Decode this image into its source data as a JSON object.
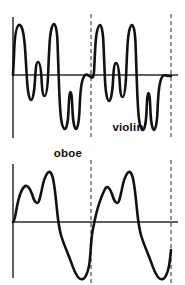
{
  "figure": {
    "title": "",
    "background_color": "#ffffff",
    "stroke_color": "#111111",
    "axis_color": "#2b2b2b",
    "period_marker_color": "#5a5a5a",
    "width": 185,
    "height": 285
  },
  "panels": [
    {
      "id": "violin",
      "label": "violin",
      "label_x": 128,
      "label_y": 131,
      "axis": {
        "vertical_x": 13,
        "vertical_y_top": 17,
        "vertical_y_bottom": 138,
        "horizontal_y": 75,
        "horizontal_x_start": 13,
        "horizontal_x_end": 178
      },
      "period_markers": [
        {
          "x": 91,
          "y_top": 14,
          "y_bottom": 140
        },
        {
          "x": 171,
          "y_top": 14,
          "y_bottom": 140
        }
      ],
      "path": "M13,75 L14,56 C14.5,38 16,26 19,25 C22,24 24,34 25,48 C26,62 26.5,72 27,80 C27.6,90 29,100 31,100 C33,100 34.5,90 35,80 C35.6,70 36,62 38,62 C40,62 41,70 41.5,78 C42,87 42.5,96 44.5,96 C46.5,96 47.5,86 48,77 C48.5,66 49,49 50,38 C51,28 52.5,24 54,24 C55.6,24 57,30 57.5,42 C58,55 58.5,72 59,85 C59.5,98 60,110 61,118 C62,126 63.5,129 65,129 C66.6,129 68,122 68.5,111 C69,100 69.3,92 70.5,92 C71.7,92 72,100 72.5,111 C73,122 74.5,129 76,129 C77.6,129 79,122 79.5,110 C80,97 80.5,88 82,82 C83.5,76 85,74.5 86.5,74.6 C88,74.7 89.5,76 91,77"
    }
  ],
  "violin_second_cycle_path": "M91,77 C92.5,78 93.5,78 94,72 C94.5,64 95,48 96,38 C97,29 98.5,25 100,25 C101.6,25 103,32 103.5,44 C104,56 104.5,70 105,80 C105.6,92 107,101 109,101 C111,101 112.5,91 113,81 C113.6,71 114,63 116,63 C118,63 119,71 119.5,79 C120,88 120.5,97 122.5,97 C124.5,97 125.5,87 126,78 C126.5,67 127,50 128,39 C129,29 130.5,25 132,25 C133.6,25 135,31 135.5,43 C136,56 136.5,73 137,86 C137.5,99 138,111 139,119 C140,127 141.5,130 143,130 C144.6,130 146,123 146.5,112 C147,101 147.3,93 148.5,93 C149.7,93 150,101 150.5,112 C151,123 152.5,130 154,130 C155.6,130 157,123 157.5,111 C158,98 158.5,89 160,83 C161.5,76 163,75 164.5,75.2 C166,75.4 167.5,76 171,76",
  "oboe_panel": {
    "id": "oboe",
    "label": "oboe",
    "label_x": 68,
    "label_y": 17,
    "axis": {
      "vertical_x": 13,
      "vertical_y_top": 24,
      "vertical_y_bottom": 138,
      "horizontal_y": 82,
      "horizontal_x_start": 13,
      "horizontal_x_end": 178
    },
    "period_markers": [
      {
        "x": 91,
        "y_top": 20,
        "y_bottom": 143
      },
      {
        "x": 171,
        "y_top": 20,
        "y_bottom": 143
      }
    ],
    "path_cycle_1": "M13,82 C14,82 15,78 16,72 C18,60 21,50 24,47 C27,44 30,48 32,54 C34,60 35,63 37,63 C39,63 40,58 41.5,51 C43,43 45,36 47.5,33 C50,30 52,33 53.5,41 C55,49 56,60 57,70 C58,80 59,88 61,95 C63,102 65.5,108 68,114 C70.5,120 73,128 75.5,133 C78,138 80.5,140 83,139 C85.5,138 87.5,133 89,126 C90,121 90.5,113 91,105",
    "path_cycle_2": "M91,105 C91.5,98 92.5,90 94,84 C95,79 96,74 97.5,69 C99.5,62 102,55 105,49 C107,45 110,48 112,54 C114,60 115,63 117,63 C119,63 120,58 121.5,51 C123,43 125,36 127.5,33 C130,30 132,33 133.5,41 C135,49 136,60 137,70 C138,80 139,88 141,95 C143,102 145.5,108 148,114 C150.5,120 153,128 155.5,133 C158,138 160.5,140 163,139 C165.5,138 167.5,133 169,126 C169.8,122 170.4,116 171,110"
  },
  "axis_labels": {
    "x_axis": "",
    "y_axis": ""
  },
  "chart_data": {
    "type": "line",
    "xlabel": "time",
    "ylabel": "amplitude",
    "grid": false,
    "legend_position": "inline",
    "panels": [
      {
        "name": "violin",
        "description": "Complex periodic waveform with many harmonics; two full periods shown between the vertical axis and the right dashed line.",
        "periods_shown": 2,
        "period_marker_x_positions": [
          91,
          171
        ],
        "zero_line_y": 75,
        "peak_amplitude_positive": 1.0,
        "peak_amplitude_negative": -0.9,
        "sample_points_cycle1": [
          {
            "t": 0.0,
            "a": 0.0
          },
          {
            "t": 0.04,
            "a": 0.95
          },
          {
            "t": 0.09,
            "a": 0.05
          },
          {
            "t": 0.13,
            "a": -0.25
          },
          {
            "t": 0.17,
            "a": 0.25
          },
          {
            "t": 0.21,
            "a": -0.3
          },
          {
            "t": 0.25,
            "a": 0.12
          },
          {
            "t": 0.3,
            "a": 0.98
          },
          {
            "t": 0.36,
            "a": 0.0
          },
          {
            "t": 0.42,
            "a": -0.85
          },
          {
            "t": 0.46,
            "a": -0.25
          },
          {
            "t": 0.5,
            "a": -0.85
          },
          {
            "t": 0.54,
            "a": 0.02
          },
          {
            "t": 0.57,
            "a": 0.0
          }
        ],
        "sample_points_cycle2": [
          {
            "t": 0.57,
            "a": 0.0
          },
          {
            "t": 0.61,
            "a": 0.95
          },
          {
            "t": 0.66,
            "a": 0.03
          },
          {
            "t": 0.7,
            "a": -0.28
          },
          {
            "t": 0.74,
            "a": 0.22
          },
          {
            "t": 0.78,
            "a": -0.32
          },
          {
            "t": 0.82,
            "a": 0.1
          },
          {
            "t": 0.86,
            "a": 0.97
          },
          {
            "t": 0.9,
            "a": 0.0
          },
          {
            "t": 0.94,
            "a": -0.88
          },
          {
            "t": 0.96,
            "a": -0.28
          },
          {
            "t": 0.98,
            "a": -0.88
          },
          {
            "t": 1.0,
            "a": 0.0
          }
        ]
      },
      {
        "name": "oboe",
        "description": "Smoother asymmetric waveform with a double-humped positive lobe and a deep single negative trough; two full periods shown.",
        "periods_shown": 2,
        "period_marker_x_positions": [
          91,
          171
        ],
        "zero_line_y": 82,
        "peak_amplitude_positive": 0.78,
        "peak_amplitude_negative": -0.95,
        "sample_points_cycle1": [
          {
            "t": 0.0,
            "a": 0.0
          },
          {
            "t": 0.07,
            "a": 0.45
          },
          {
            "t": 0.11,
            "a": 0.38
          },
          {
            "t": 0.16,
            "a": 0.75
          },
          {
            "t": 0.22,
            "a": 0.3
          },
          {
            "t": 0.28,
            "a": -0.1
          },
          {
            "t": 0.36,
            "a": -0.6
          },
          {
            "t": 0.43,
            "a": -0.95
          },
          {
            "t": 0.48,
            "a": -0.7
          },
          {
            "t": 0.5,
            "a": -0.35
          }
        ],
        "sample_points_cycle2": [
          {
            "t": 0.5,
            "a": -0.35
          },
          {
            "t": 0.57,
            "a": 0.45
          },
          {
            "t": 0.61,
            "a": 0.38
          },
          {
            "t": 0.66,
            "a": 0.75
          },
          {
            "t": 0.72,
            "a": 0.3
          },
          {
            "t": 0.78,
            "a": -0.1
          },
          {
            "t": 0.86,
            "a": -0.6
          },
          {
            "t": 0.93,
            "a": -0.95
          },
          {
            "t": 0.98,
            "a": -0.7
          },
          {
            "t": 1.0,
            "a": -0.3
          }
        ]
      }
    ]
  }
}
